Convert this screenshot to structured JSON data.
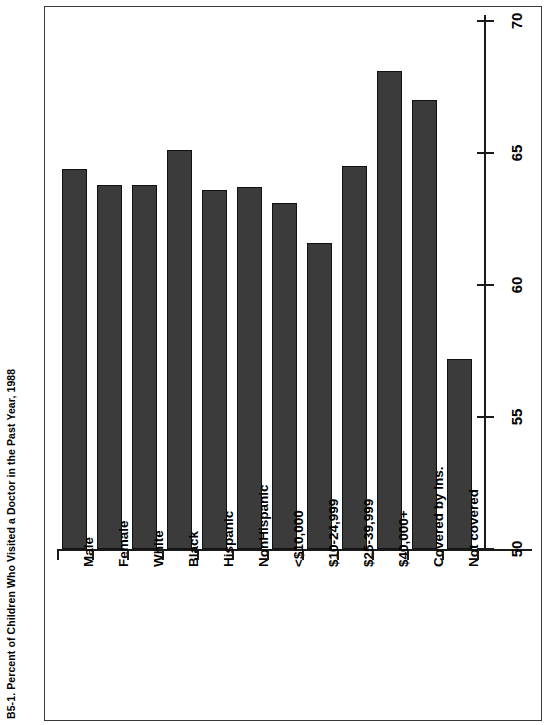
{
  "figure": {
    "title": "B5-1. Percent of Children Who Visited a Doctor in the Past Year, 1988"
  },
  "chart_data": {
    "type": "bar",
    "title": "B5-1. Percent of Children Who Visited a Doctor in the Past Year, 1988",
    "xlabel": "",
    "ylabel": "",
    "orientation": "vertical-rotated-90",
    "grid": false,
    "legend": "none",
    "ylim": [
      50,
      70
    ],
    "yticks": [
      50,
      55,
      60,
      65,
      70
    ],
    "ytick_labels": [
      "50",
      "55",
      "60",
      "65",
      "70"
    ],
    "categories": [
      "Male",
      "Female",
      "White",
      "Black",
      "Hispanic",
      "NonHispanic",
      "<$10,000",
      "$10-24,999",
      "$25-39,999",
      "$40,000+",
      "Covered by Ins.",
      "Not covered"
    ],
    "values": [
      64.4,
      63.8,
      63.8,
      65.1,
      63.6,
      63.7,
      63.1,
      61.6,
      64.5,
      68.1,
      67.0,
      57.2
    ]
  }
}
